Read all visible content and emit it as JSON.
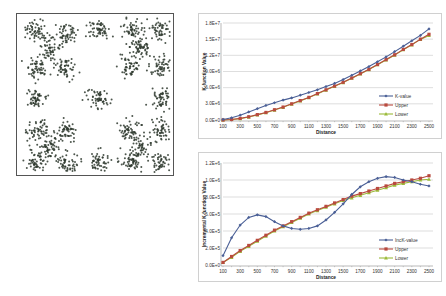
{
  "scatter": {
    "cluster_centers": [
      [
        0.12,
        0.1
      ],
      [
        0.35,
        0.12
      ],
      [
        0.6,
        0.1
      ],
      [
        0.86,
        0.1
      ],
      [
        1.08,
        0.1
      ],
      [
        0.22,
        0.22
      ],
      [
        0.93,
        0.22
      ],
      [
        0.12,
        0.35
      ],
      [
        0.35,
        0.37
      ],
      [
        0.84,
        0.35
      ],
      [
        1.08,
        0.35
      ],
      [
        0.12,
        0.58
      ],
      [
        0.6,
        0.58
      ],
      [
        1.08,
        0.58
      ],
      [
        0.12,
        0.8
      ],
      [
        0.35,
        0.8
      ],
      [
        0.84,
        0.8
      ],
      [
        1.08,
        0.8
      ],
      [
        0.22,
        0.92
      ],
      [
        0.93,
        0.92
      ],
      [
        0.12,
        1.02
      ],
      [
        0.35,
        1.03
      ],
      [
        0.6,
        1.02
      ],
      [
        0.86,
        1.02
      ],
      [
        1.08,
        1.02
      ]
    ],
    "point_color": "#2f3a2f"
  },
  "chart_data": [
    {
      "type": "line",
      "title": "",
      "xlabel": "Distance",
      "ylabel": "K-function Value",
      "ylim": [
        0,
        18000000
      ],
      "yticks": [
        "0.0E+0",
        "3.0E+6",
        "6.0E+6",
        "9.0E+6",
        "1.2E+7",
        "1.5E+7",
        "1.8E+7"
      ],
      "xtick_labels": [
        "100",
        "300",
        "500",
        "700",
        "900",
        "1100",
        "1300",
        "1500",
        "1700",
        "1900",
        "2100",
        "2300",
        "2500"
      ],
      "x": [
        100,
        200,
        300,
        400,
        500,
        600,
        700,
        800,
        900,
        1000,
        1100,
        1200,
        1300,
        1400,
        1500,
        1600,
        1700,
        1800,
        1900,
        2000,
        2100,
        2200,
        2300,
        2400,
        2500
      ],
      "grid": true,
      "legend_position": "lower right",
      "series": [
        {
          "name": "K-value",
          "color": "#4a5f96",
          "marker": "diamond",
          "values": [
            100000,
            400000,
            900000,
            1500000,
            2100000,
            2700000,
            3200000,
            3700000,
            4100000,
            4600000,
            5100000,
            5600000,
            6200000,
            6800000,
            7500000,
            8300000,
            9100000,
            9900000,
            10800000,
            11700000,
            12700000,
            13700000,
            14700000,
            15700000,
            16900000
          ]
        },
        {
          "name": "Upper",
          "color": "#b84a3e",
          "marker": "square",
          "values": [
            0,
            100000,
            300000,
            600000,
            1000000,
            1400000,
            1900000,
            2400000,
            3000000,
            3600000,
            4200000,
            4900000,
            5600000,
            6300000,
            7000000,
            7800000,
            8600000,
            9400000,
            10300000,
            11200000,
            12100000,
            13100000,
            14000000,
            15000000,
            15900000
          ]
        },
        {
          "name": "Lower",
          "color": "#9bbb3a",
          "marker": "triangle",
          "values": [
            0,
            100000,
            250000,
            550000,
            950000,
            1350000,
            1850000,
            2350000,
            2950000,
            3550000,
            4150000,
            4850000,
            5550000,
            6250000,
            6950000,
            7750000,
            8550000,
            9350000,
            10250000,
            11150000,
            12050000,
            13050000,
            13950000,
            14950000,
            15700000
          ]
        }
      ]
    },
    {
      "type": "line",
      "title": "",
      "xlabel": "Distance",
      "ylabel": "Incremental K-function Value",
      "ylim": [
        0,
        1200000
      ],
      "yticks": [
        "0.0E+0",
        "2.0E+5",
        "4.0E+5",
        "6.0E+5",
        "8.0E+5",
        "1.0E+6",
        "1.2E+6"
      ],
      "xtick_labels": [
        "100",
        "300",
        "500",
        "700",
        "900",
        "1100",
        "1300",
        "1500",
        "1700",
        "1900",
        "2100",
        "2300",
        "2500"
      ],
      "x": [
        100,
        200,
        300,
        400,
        500,
        600,
        700,
        800,
        900,
        1000,
        1100,
        1200,
        1300,
        1400,
        1500,
        1600,
        1700,
        1800,
        1900,
        2000,
        2100,
        2200,
        2300,
        2400,
        2500
      ],
      "grid": true,
      "legend_position": "lower right",
      "series": [
        {
          "name": "IncK-value",
          "color": "#4a5f96",
          "marker": "diamond",
          "values": [
            110000,
            320000,
            470000,
            560000,
            590000,
            570000,
            510000,
            460000,
            430000,
            420000,
            430000,
            460000,
            530000,
            620000,
            720000,
            830000,
            920000,
            980000,
            1020000,
            1040000,
            1030000,
            1000000,
            980000,
            950000,
            930000
          ]
        },
        {
          "name": "Upper",
          "color": "#b84a3e",
          "marker": "square",
          "values": [
            30000,
            100000,
            170000,
            230000,
            290000,
            350000,
            410000,
            460000,
            510000,
            560000,
            610000,
            650000,
            690000,
            730000,
            770000,
            810000,
            840000,
            870000,
            900000,
            930000,
            960000,
            980000,
            1000000,
            1020000,
            1050000
          ]
        },
        {
          "name": "Lower",
          "color": "#9bbb3a",
          "marker": "triangle",
          "values": [
            30000,
            90000,
            160000,
            220000,
            280000,
            340000,
            400000,
            450000,
            500000,
            550000,
            600000,
            640000,
            680000,
            720000,
            760000,
            790000,
            820000,
            850000,
            880000,
            910000,
            940000,
            960000,
            980000,
            1000000,
            1010000
          ]
        }
      ]
    }
  ]
}
